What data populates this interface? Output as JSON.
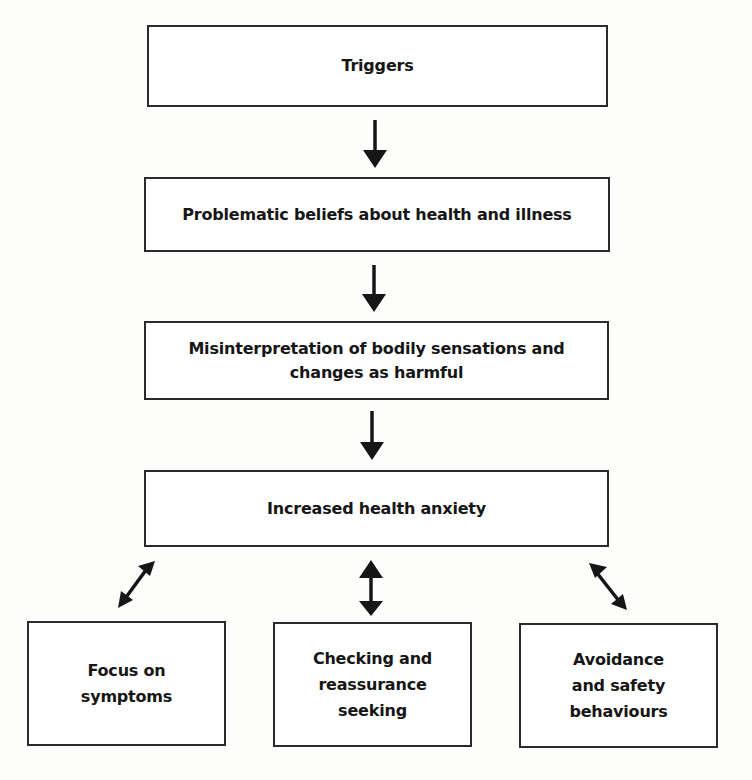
{
  "diagram": {
    "type": "flowchart",
    "nodes": {
      "triggers": "Triggers",
      "beliefs": "Problematic beliefs about health and illness",
      "misinterpretation": "Misinterpretation of bodily sensations and\nchanges as harmful",
      "anxiety": "Increased health anxiety",
      "focus": "Focus on\nsymptoms",
      "checking": "Checking and\nreassurance\nseeking",
      "avoidance": "Avoidance\nand safety\nbehaviours"
    },
    "edges": [
      {
        "from": "triggers",
        "to": "beliefs",
        "type": "one-way"
      },
      {
        "from": "beliefs",
        "to": "misinterpretation",
        "type": "one-way"
      },
      {
        "from": "misinterpretation",
        "to": "anxiety",
        "type": "one-way"
      },
      {
        "from": "anxiety",
        "to": "focus",
        "type": "two-way"
      },
      {
        "from": "anxiety",
        "to": "checking",
        "type": "two-way"
      },
      {
        "from": "anxiety",
        "to": "avoidance",
        "type": "two-way"
      }
    ],
    "colors": {
      "border": "#2a2a2a",
      "text": "#161616",
      "background": "#fdfdfb"
    }
  }
}
